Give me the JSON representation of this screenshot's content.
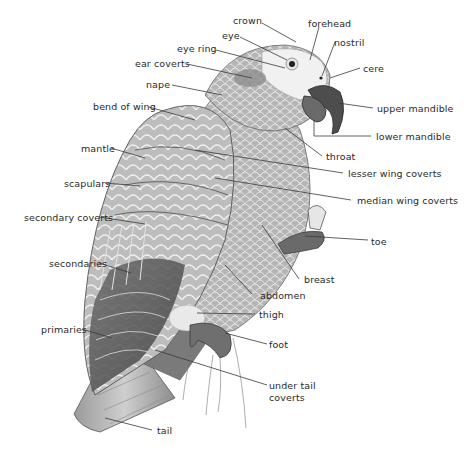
{
  "diagram": {
    "labels": {
      "crown": "crown",
      "forehead": "forehead",
      "eye": "eye",
      "nostril": "nostril",
      "eye_ring": "eye ring",
      "ear_coverts": "ear coverts",
      "cere": "cere",
      "nape": "nape",
      "upper_mandible": "upper mandible",
      "bend_of_wing": "bend of wing",
      "lower_mandible": "lower mandible",
      "throat": "throat",
      "mantle": "mantle",
      "lesser_wing_coverts": "lesser wing coverts",
      "scapulars": "scapulars",
      "median_wing_coverts": "median wing coverts",
      "secondary_coverts": "secondary coverts",
      "toe": "toe",
      "secondaries": "secondaries",
      "breast": "breast",
      "abdomen": "abdomen",
      "thigh": "thigh",
      "primaries": "primaries",
      "foot": "foot",
      "under_tail_coverts_line1": "under tail",
      "under_tail_coverts_line2": "coverts",
      "tail": "tail"
    },
    "colors": {
      "line": "#3a3a3a",
      "text": "#2a2a2a",
      "feather_light": "#d6d6d6",
      "feather_mid": "#a8a8a8",
      "feather_dark": "#5a5a5a",
      "face": "#f2f2f2",
      "beak": "#4a4a4a"
    }
  }
}
